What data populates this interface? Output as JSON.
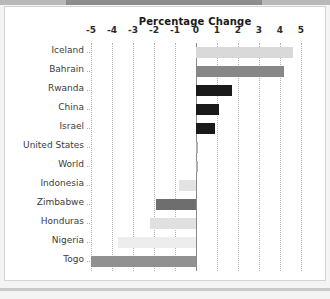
{
  "chart_data": {
    "type": "bar",
    "orientation": "horizontal",
    "title": "Percentage Change",
    "xlabel": "",
    "ylabel": "",
    "xlim": [
      -5,
      5
    ],
    "xticks": [
      "-5",
      "-4",
      "-3",
      "-2",
      "-1",
      "0",
      "1",
      "2",
      "3",
      "4",
      "5"
    ],
    "xtick_values": [
      -5,
      -4,
      -3,
      -2,
      -1,
      0,
      1,
      2,
      3,
      4,
      5
    ],
    "grid": true,
    "legend": "none",
    "categories": [
      "Iceland",
      "Bahrain",
      "Rwanda",
      "China",
      "Israel",
      "United States",
      "World",
      "Indonesia",
      "Zimbabwe",
      "Honduras",
      "Nigeria",
      "Togo"
    ],
    "values": [
      4.6,
      4.2,
      1.7,
      1.1,
      0.9,
      0.1,
      0.1,
      -0.8,
      -1.9,
      -2.2,
      -3.7,
      -5.0
    ],
    "bar_colors": [
      "#d9d9d9",
      "#878787",
      "#1a1a1a",
      "#1a1a1a",
      "#1a1a1a",
      "#b0b0b0",
      "#b0b0b0",
      "#e3e3e3",
      "#6e6e6e",
      "#e0e0e0",
      "#ededed",
      "#919191"
    ]
  },
  "colors": {
    "page_background": "#f4f4f4",
    "card_background": "#ffffff",
    "card_border": "#d4d4d4",
    "gridline": "#b0b0b0",
    "zeroline": "#8a8a8a",
    "title_text": "#1a1a1a",
    "label_text": "#3c3c3c",
    "top_band": "#b9b9b9",
    "top_band_inner": "#8d8d8d"
  }
}
